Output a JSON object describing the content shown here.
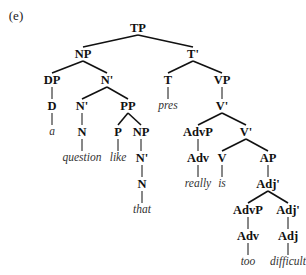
{
  "figure_label": "(e)",
  "tree": {
    "nodes": [
      {
        "id": "TP",
        "label": "TP",
        "kind": "cat",
        "x": 138,
        "y": 28
      },
      {
        "id": "NP1",
        "label": "NP",
        "kind": "cat",
        "x": 83,
        "y": 54
      },
      {
        "id": "Tbar",
        "label": "T'",
        "kind": "cat",
        "x": 193,
        "y": 54
      },
      {
        "id": "DP",
        "label": "DP",
        "kind": "cat",
        "x": 52,
        "y": 80
      },
      {
        "id": "Nbar1",
        "label": "N'",
        "kind": "cat",
        "x": 107,
        "y": 80
      },
      {
        "id": "T",
        "label": "T",
        "kind": "cat",
        "x": 168,
        "y": 80
      },
      {
        "id": "VP",
        "label": "VP",
        "kind": "cat",
        "x": 222,
        "y": 80
      },
      {
        "id": "D",
        "label": "D",
        "kind": "cat",
        "x": 52,
        "y": 106
      },
      {
        "id": "Nbar2",
        "label": "N'",
        "kind": "cat",
        "x": 82,
        "y": 106
      },
      {
        "id": "PP",
        "label": "PP",
        "kind": "cat",
        "x": 128,
        "y": 106
      },
      {
        "id": "pres",
        "label": "pres",
        "kind": "word",
        "x": 168,
        "y": 106
      },
      {
        "id": "Vbar1",
        "label": "V'",
        "kind": "cat",
        "x": 222,
        "y": 106
      },
      {
        "id": "a",
        "label": "a",
        "kind": "word",
        "x": 52,
        "y": 132
      },
      {
        "id": "N1",
        "label": "N",
        "kind": "cat",
        "x": 82,
        "y": 132
      },
      {
        "id": "P",
        "label": "P",
        "kind": "cat",
        "x": 118,
        "y": 132
      },
      {
        "id": "NP2",
        "label": "NP",
        "kind": "cat",
        "x": 141,
        "y": 132
      },
      {
        "id": "AdvP1",
        "label": "AdvP",
        "kind": "cat",
        "x": 198,
        "y": 132
      },
      {
        "id": "Vbar2",
        "label": "V'",
        "kind": "cat",
        "x": 246,
        "y": 132
      },
      {
        "id": "question",
        "label": "question",
        "kind": "word",
        "x": 82,
        "y": 158
      },
      {
        "id": "like",
        "label": "like",
        "kind": "word",
        "x": 118,
        "y": 158
      },
      {
        "id": "Nbar3",
        "label": "N'",
        "kind": "cat",
        "x": 142,
        "y": 158
      },
      {
        "id": "Adv1",
        "label": "Adv",
        "kind": "cat",
        "x": 198,
        "y": 158
      },
      {
        "id": "V",
        "label": "V",
        "kind": "cat",
        "x": 222,
        "y": 158
      },
      {
        "id": "AP",
        "label": "AP",
        "kind": "cat",
        "x": 268,
        "y": 158
      },
      {
        "id": "N2",
        "label": "N",
        "kind": "cat",
        "x": 142,
        "y": 184
      },
      {
        "id": "really",
        "label": "really",
        "kind": "word",
        "x": 198,
        "y": 184
      },
      {
        "id": "is",
        "label": "is",
        "kind": "word",
        "x": 222,
        "y": 184
      },
      {
        "id": "Adjbar1",
        "label": "Adj'",
        "kind": "cat",
        "x": 268,
        "y": 184
      },
      {
        "id": "that",
        "label": "that",
        "kind": "word",
        "x": 142,
        "y": 210
      },
      {
        "id": "AdvP2",
        "label": "AdvP",
        "kind": "cat",
        "x": 248,
        "y": 210
      },
      {
        "id": "Adjbar2",
        "label": "Adj'",
        "kind": "cat",
        "x": 288,
        "y": 210
      },
      {
        "id": "Adv2",
        "label": "Adv",
        "kind": "cat",
        "x": 248,
        "y": 236
      },
      {
        "id": "Adj",
        "label": "Adj",
        "kind": "cat",
        "x": 288,
        "y": 236
      },
      {
        "id": "too",
        "label": "too",
        "kind": "word",
        "x": 248,
        "y": 262
      },
      {
        "id": "difficult",
        "label": "difficult",
        "kind": "word",
        "x": 288,
        "y": 262
      }
    ],
    "edges": [
      [
        "TP",
        "NP1"
      ],
      [
        "TP",
        "Tbar"
      ],
      [
        "NP1",
        "DP"
      ],
      [
        "NP1",
        "Nbar1"
      ],
      [
        "Tbar",
        "T"
      ],
      [
        "Tbar",
        "VP"
      ],
      [
        "DP",
        "D"
      ],
      [
        "D",
        "a"
      ],
      [
        "Nbar1",
        "Nbar2"
      ],
      [
        "Nbar1",
        "PP"
      ],
      [
        "Nbar2",
        "N1"
      ],
      [
        "N1",
        "question"
      ],
      [
        "PP",
        "P"
      ],
      [
        "PP",
        "NP2"
      ],
      [
        "P",
        "like"
      ],
      [
        "NP2",
        "Nbar3"
      ],
      [
        "Nbar3",
        "N2"
      ],
      [
        "N2",
        "that"
      ],
      [
        "T",
        "pres"
      ],
      [
        "VP",
        "Vbar1"
      ],
      [
        "Vbar1",
        "AdvP1"
      ],
      [
        "Vbar1",
        "Vbar2"
      ],
      [
        "AdvP1",
        "Adv1"
      ],
      [
        "Adv1",
        "really"
      ],
      [
        "Vbar2",
        "V"
      ],
      [
        "Vbar2",
        "AP"
      ],
      [
        "V",
        "is"
      ],
      [
        "AP",
        "Adjbar1"
      ],
      [
        "Adjbar1",
        "AdvP2"
      ],
      [
        "Adjbar1",
        "Adjbar2"
      ],
      [
        "AdvP2",
        "Adv2"
      ],
      [
        "Adv2",
        "too"
      ],
      [
        "Adjbar2",
        "Adj"
      ],
      [
        "Adj",
        "difficult"
      ]
    ]
  },
  "colors": {
    "line": "#111111",
    "category_text": "#111111",
    "word_text": "#333333",
    "background": "#ffffff"
  }
}
